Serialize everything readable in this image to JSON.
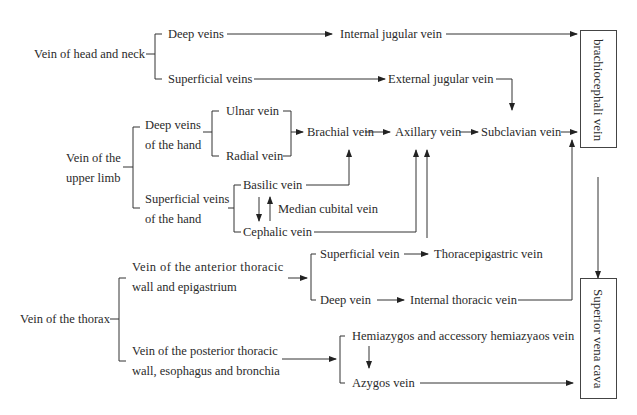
{
  "boxes": {
    "brachiocephalic": "brachiocephali vein",
    "svc": "Superior vena cava"
  },
  "head_neck": {
    "label": "Vein of head and neck",
    "deep": "Deep veins",
    "superficial": "Superficial veins",
    "internal_jugular": "Internal jugular vein",
    "external_jugular": "External jugular vein"
  },
  "upper_limb": {
    "label_l1": "Vein of the",
    "label_l2": "upper limb",
    "deep_l1": "Deep veins",
    "deep_l2": "of the hand",
    "ulnar": "Ulnar vein",
    "radial": "Radial vein",
    "superficial_l1": "Superficial veins",
    "superficial_l2": "of the hand",
    "basilic": "Basilic vein",
    "median_cubital": "Median cubital vein",
    "cephalic": "Cephalic vein",
    "brachial": "Brachial vein",
    "axillary": "Axillary vein",
    "subclavian": "Subclavian vein"
  },
  "thorax": {
    "label": "Vein of the thorax",
    "anterior_l1": "Vein of the anterior thoracic",
    "anterior_l2": "wall and epigastrium",
    "superficial": "Superficial vein",
    "thoracepigastric": "Thoracepigastric vein",
    "deep": "Deep vein",
    "internal_thoracic": "Internal thoracic vein",
    "posterior_l1": "Vein of the posterior thoracic",
    "posterior_l2": "wall, esophagus and bronchia",
    "hemiazygos": "Hemiazygos and accessory hemiazyaos vein",
    "azygos": "Azygos vein"
  }
}
